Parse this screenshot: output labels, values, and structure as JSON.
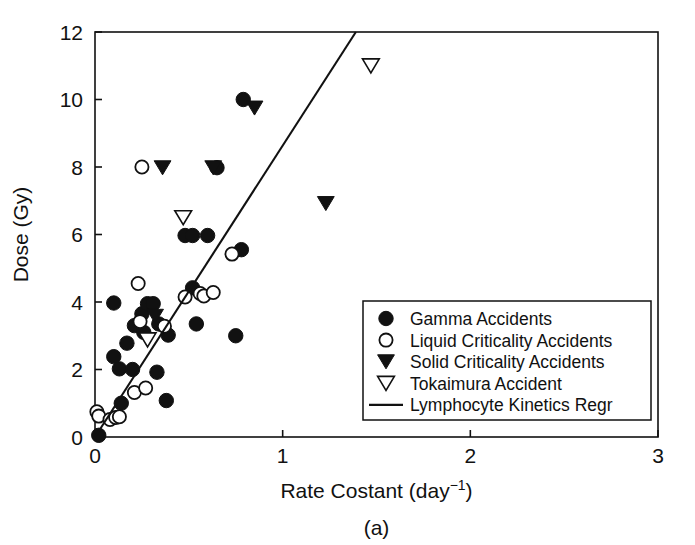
{
  "figure": {
    "panel_label": "(a)",
    "background_color": "#ffffff",
    "ink_color": "#111111"
  },
  "chart_data": {
    "type": "scatter",
    "title": "",
    "subtitle": "",
    "xlabel": "Rate Costant (day⁻¹)",
    "xlabel_base": "Rate Costant (day",
    "xlabel_exponent": "−1",
    "xlabel_tail": ")",
    "ylabel": "Dose (Gy)",
    "xlim": [
      0,
      3
    ],
    "ylim": [
      0,
      12
    ],
    "xticks": [
      0,
      1,
      2,
      3
    ],
    "xticklabels": [
      "0",
      "1",
      "2",
      "3"
    ],
    "yticks": [
      0,
      2,
      4,
      6,
      8,
      10,
      12
    ],
    "yticklabels": [
      "0",
      "2",
      "4",
      "6",
      "8",
      "10",
      "12"
    ],
    "grid": false,
    "legend_position": "lower-right",
    "series": [
      {
        "name": "Gamma Accidents",
        "marker": "filled-circle",
        "color": "#111111",
        "points": [
          [
            0.02,
            0.05
          ],
          [
            0.1,
            3.97
          ],
          [
            0.1,
            2.38
          ],
          [
            0.13,
            2.02
          ],
          [
            0.14,
            1.0
          ],
          [
            0.17,
            2.78
          ],
          [
            0.2,
            2.0
          ],
          [
            0.21,
            3.3
          ],
          [
            0.25,
            3.65
          ],
          [
            0.26,
            3.1
          ],
          [
            0.28,
            3.95
          ],
          [
            0.31,
            3.95
          ],
          [
            0.33,
            1.92
          ],
          [
            0.34,
            3.35
          ],
          [
            0.38,
            1.08
          ],
          [
            0.39,
            3.02
          ],
          [
            0.48,
            5.97
          ],
          [
            0.52,
            5.97
          ],
          [
            0.52,
            4.42
          ],
          [
            0.54,
            3.35
          ],
          [
            0.6,
            5.97
          ],
          [
            0.65,
            7.98
          ],
          [
            0.75,
            3.0
          ],
          [
            0.78,
            5.55
          ],
          [
            0.79,
            10.0
          ]
        ]
      },
      {
        "name": "Liquid Criticality Accidents",
        "marker": "open-circle",
        "color": "#111111",
        "points": [
          [
            0.01,
            0.75
          ],
          [
            0.02,
            0.62
          ],
          [
            0.08,
            0.52
          ],
          [
            0.11,
            0.58
          ],
          [
            0.13,
            0.6
          ],
          [
            0.21,
            1.32
          ],
          [
            0.23,
            4.55
          ],
          [
            0.24,
            3.42
          ],
          [
            0.25,
            8.0
          ],
          [
            0.27,
            1.45
          ],
          [
            0.37,
            3.28
          ],
          [
            0.48,
            4.15
          ],
          [
            0.56,
            4.25
          ],
          [
            0.58,
            4.18
          ],
          [
            0.63,
            4.28
          ],
          [
            0.73,
            5.42
          ]
        ]
      },
      {
        "name": "Solid Criticality Accidents",
        "marker": "filled-triangle",
        "color": "#111111",
        "points": [
          [
            0.32,
            3.58
          ],
          [
            0.36,
            7.98
          ],
          [
            0.63,
            7.98
          ],
          [
            0.85,
            9.75
          ],
          [
            1.23,
            6.92
          ]
        ]
      },
      {
        "name": "Tokaimura Accident",
        "marker": "open-triangle",
        "color": "#111111",
        "points": [
          [
            0.28,
            2.88
          ],
          [
            0.47,
            6.5
          ],
          [
            1.47,
            11.0
          ]
        ]
      }
    ],
    "regression": {
      "name": "Lymphocyte Kinetics Regr",
      "marker": "line",
      "color": "#111111",
      "x": [
        0.0,
        1.39
      ],
      "y": [
        0.0,
        12.0
      ],
      "slope": 8.63,
      "intercept": 0.0
    }
  },
  "legend": {
    "items": [
      {
        "label": "Gamma Accidents",
        "marker": "filled-circle"
      },
      {
        "label": "Liquid Criticality Accidents",
        "marker": "open-circle"
      },
      {
        "label": "Solid Criticality Accidents",
        "marker": "filled-triangle"
      },
      {
        "label": "Tokaimura Accident",
        "marker": "open-triangle"
      },
      {
        "label": "Lymphocyte Kinetics Regr",
        "marker": "line"
      }
    ]
  }
}
